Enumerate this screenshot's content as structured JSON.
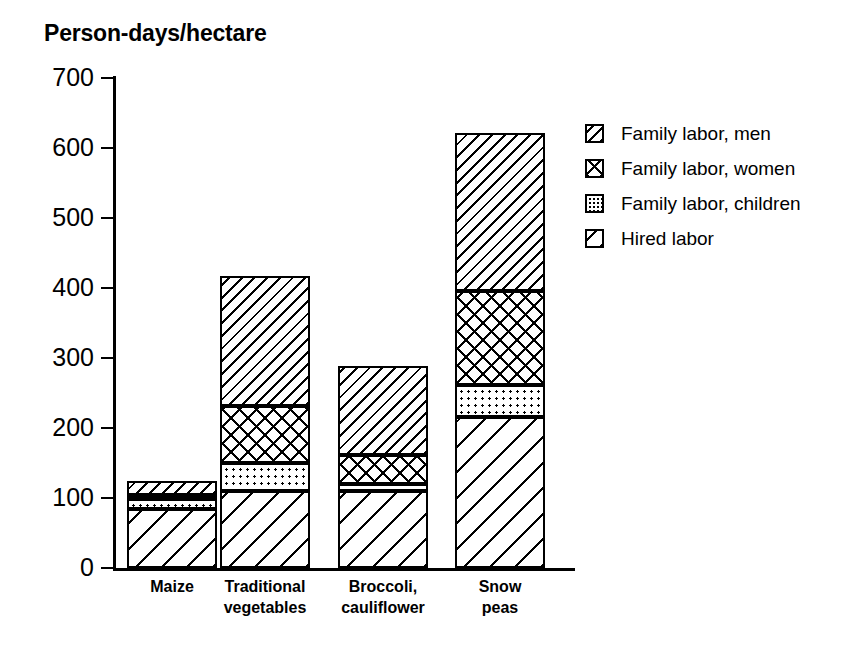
{
  "chart_data": {
    "type": "bar",
    "subtype": "stacked",
    "title": "Person-days/hectare",
    "xlabel": "",
    "ylabel": "Person-days/hectare",
    "ylim": [
      0,
      700
    ],
    "ytick_step": 100,
    "yticks": [
      700,
      600,
      500,
      400,
      300,
      200,
      100,
      0
    ],
    "grid": false,
    "legend_position": "right",
    "categories": [
      "Maize",
      "Traditional vegetables",
      "Broccoli, cauliflower",
      "Snow peas"
    ],
    "category_lines": [
      [
        "Maize"
      ],
      [
        "Traditional",
        "vegetables"
      ],
      [
        "Broccoli,",
        "cauliflower"
      ],
      [
        "Snow",
        "peas"
      ]
    ],
    "series": [
      {
        "name": "Hired labor",
        "pattern": "wide-diagonal-hatch",
        "values": [
          85,
          110,
          110,
          216
        ]
      },
      {
        "name": "Family labor, children",
        "pattern": "dotted",
        "values": [
          13,
          40,
          10,
          46
        ]
      },
      {
        "name": "Family labor, women",
        "pattern": "cross-hatch",
        "values": [
          7,
          82,
          42,
          134
        ]
      },
      {
        "name": "Family labor, men",
        "pattern": "narrow-diagonal-hatch",
        "values": [
          20,
          185,
          127,
          225
        ]
      }
    ],
    "stack_order_bottom_to_top": [
      "Hired labor",
      "Family labor, children",
      "Family labor, women",
      "Family labor, men"
    ],
    "totals": [
      125,
      417,
      289,
      621
    ]
  },
  "legend": {
    "items": [
      {
        "label": "Family labor, men",
        "pattern": "narrow-diagonal-hatch"
      },
      {
        "label": "Family labor, women",
        "pattern": "cross-hatch"
      },
      {
        "label": "Family labor, children",
        "pattern": "dotted"
      },
      {
        "label": "Hired labor",
        "pattern": "wide-diagonal-hatch"
      }
    ]
  },
  "colors": {
    "ink": "#000000",
    "background": "#ffffff"
  }
}
